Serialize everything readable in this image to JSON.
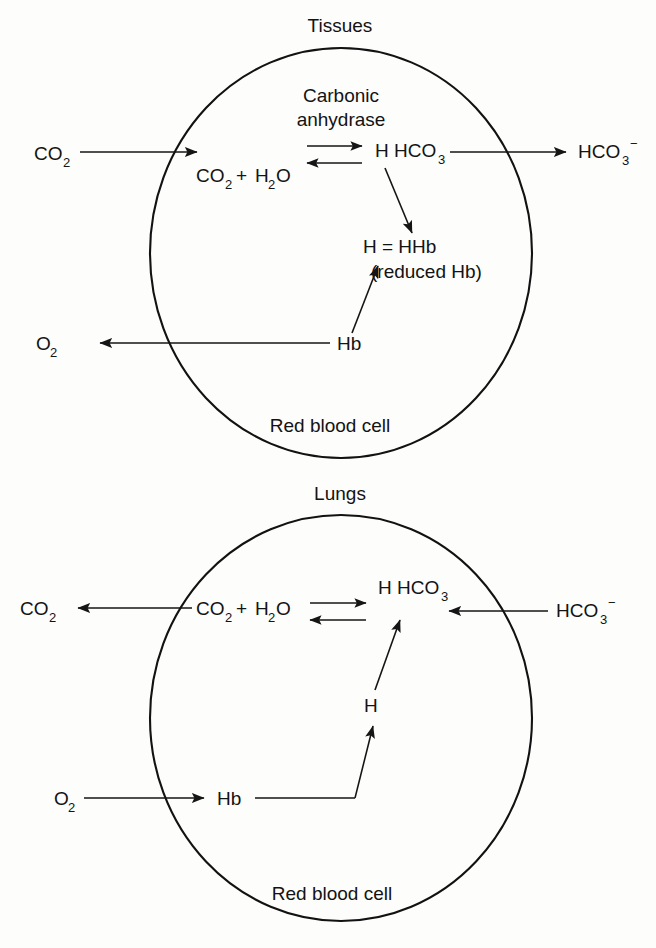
{
  "figure": {
    "type": "diagram",
    "panels": [
      {
        "id": "tissues",
        "title": "Tissues",
        "cell_label": "Red blood cell",
        "enzyme_label_line1": "Carbonic",
        "enzyme_label_line2": "anhydrase",
        "external_left_top": "CO",
        "external_left_top_sub": "2",
        "external_right": "HCO",
        "external_right_sub": "3",
        "external_right_sup": "−",
        "external_left_bottom": "O",
        "external_left_bottom_sub": "2",
        "reactant_co2": "CO",
        "reactant_co2_sub": "2",
        "reactant_plus": "+",
        "reactant_h2o_a": "H",
        "reactant_h2o_sub": "2",
        "reactant_h2o_b": "O",
        "product_h": "H",
        "product_hco3": "HCO",
        "product_hco3_sub": "3",
        "hhb_text": "H = HHb",
        "hhb_note": "(reduced Hb)",
        "hb_label": "Hb"
      },
      {
        "id": "lungs",
        "title": "Lungs",
        "cell_label": "Red blood cell",
        "external_left_top": "CO",
        "external_left_top_sub": "2",
        "external_right": "HCO",
        "external_right_sub": "3",
        "external_right_sup": "−",
        "external_left_bottom": "O",
        "external_left_bottom_sub": "2",
        "reactant_co2": "CO",
        "reactant_co2_sub": "2",
        "reactant_plus": "+",
        "reactant_h2o_a": "H",
        "reactant_h2o_sub": "2",
        "reactant_h2o_b": "O",
        "product_h": "H",
        "product_hco3": "HCO",
        "product_hco3_sub": "3",
        "h_ion_label": "H",
        "hb_label": "Hb"
      }
    ],
    "colors": {
      "ink": "#131313",
      "background": "#fdfdfc"
    }
  }
}
